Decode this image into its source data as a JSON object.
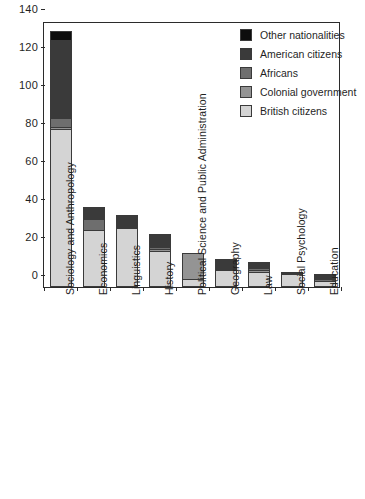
{
  "chart_data": {
    "type": "bar",
    "subtype": "stacked-vertical",
    "title": "",
    "xlabel": "",
    "ylabel": "",
    "ylim": [
      0,
      140
    ],
    "ytick_interval": 20,
    "yticks": [
      0,
      20,
      40,
      60,
      80,
      100,
      120,
      140
    ],
    "ytick_labels": [
      "0",
      "20",
      "40",
      "60",
      "80",
      "100",
      "120",
      "140"
    ],
    "grid": false,
    "legend_position": "top-right",
    "categories": [
      "Sociology and Anthropology",
      "Economics",
      "Linguistics",
      "History",
      "Political Science and Public Administration",
      "Geography",
      "Law",
      "Social Psychology",
      "Education"
    ],
    "series": [
      {
        "name": "British citizens",
        "color": "#d4d4d4",
        "values": [
          83,
          30,
          31,
          19,
          4,
          9,
          8,
          7,
          3
        ]
      },
      {
        "name": "Colonial government",
        "color": "#949494",
        "values": [
          1,
          0,
          0,
          1,
          14,
          0,
          1,
          0,
          0
        ]
      },
      {
        "name": "Africans",
        "color": "#6e6e6e",
        "values": [
          5,
          6,
          0,
          1,
          0,
          0,
          1,
          0,
          1
        ]
      },
      {
        "name": "American citizens",
        "color": "#3a3a3a",
        "values": [
          41,
          6,
          7,
          7,
          0,
          6,
          3,
          1,
          3
        ]
      },
      {
        "name": "Other nationalities",
        "color": "#0d0d0d",
        "values": [
          5,
          0,
          0,
          0,
          0,
          0,
          0,
          0,
          0
        ]
      }
    ],
    "totals": [
      135,
      42,
      38,
      28,
      18,
      15,
      13,
      8,
      7
    ],
    "legend_entries": [
      "Other nationalities",
      "American citizens",
      "Africans",
      "Colonial government",
      "British citizens"
    ]
  },
  "axis": {
    "y_max_label": "140",
    "y_min_label": "0"
  }
}
